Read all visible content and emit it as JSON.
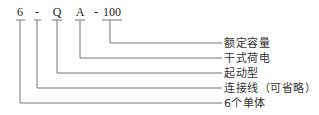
{
  "diagram": {
    "type": "model-code-breakdown",
    "code_parts": [
      {
        "id": "cells",
        "text": "6",
        "x": 20
      },
      {
        "id": "dash1",
        "text": "-",
        "x": 37
      },
      {
        "id": "type",
        "text": "Q",
        "x": 57
      },
      {
        "id": "charge",
        "text": "A",
        "x": 80
      },
      {
        "id": "dash2",
        "text": "-",
        "x": 96
      },
      {
        "id": "capacity",
        "text": "100",
        "x": 112
      }
    ],
    "labels": [
      {
        "id": "capacity",
        "text": "额定容量",
        "y": 43
      },
      {
        "id": "charge",
        "text": "干式荷电",
        "y": 58
      },
      {
        "id": "type",
        "text": "起动型",
        "y": 73
      },
      {
        "id": "dash1",
        "text": "连接线（可省略）",
        "y": 88
      },
      {
        "id": "cells",
        "text": "6个单体",
        "y": 103
      }
    ],
    "line_color": "#777777",
    "text_color": "#222222"
  }
}
